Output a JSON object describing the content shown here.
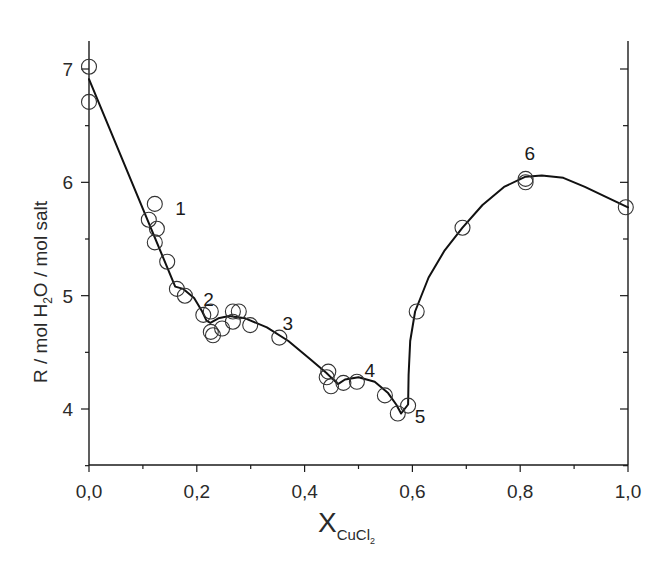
{
  "chart_data": {
    "type": "scatter",
    "title": "",
    "xlabel": "X",
    "xlabel_subscript": "CuCl",
    "xlabel_sub_subscript": "2",
    "ylabel_parts": [
      "R  /  mol H",
      "2",
      "O / mol salt"
    ],
    "ylabel": "R / mol H2O / mol salt",
    "xlim": [
      0.0,
      1.0
    ],
    "ylim": [
      3.5,
      7.25
    ],
    "grid": false,
    "legend": null,
    "x_ticks": [
      0.0,
      0.2,
      0.4,
      0.6,
      0.8,
      1.0
    ],
    "x_tick_labels": [
      "0,0",
      "0,2",
      "0,4",
      "0,6",
      "0,8",
      "1,0"
    ],
    "x_minor_ticks": [
      0.1,
      0.3,
      0.5,
      0.7,
      0.9
    ],
    "y_ticks": [
      4,
      5,
      6,
      7
    ],
    "y_tick_labels": [
      "4",
      "5",
      "6",
      "7"
    ],
    "y_minor_ticks": [
      3.5,
      4.5,
      5.5,
      6.5
    ],
    "series": [
      {
        "name": "experimental",
        "marker": "open-circle",
        "points": [
          [
            0.0,
            7.02
          ],
          [
            0.0,
            6.71
          ],
          [
            0.111,
            5.67
          ],
          [
            0.122,
            5.81
          ],
          [
            0.126,
            5.59
          ],
          [
            0.122,
            5.47
          ],
          [
            0.145,
            5.3
          ],
          [
            0.163,
            5.06
          ],
          [
            0.178,
            5.0
          ],
          [
            0.212,
            4.83
          ],
          [
            0.226,
            4.86
          ],
          [
            0.226,
            4.68
          ],
          [
            0.23,
            4.65
          ],
          [
            0.247,
            4.71
          ],
          [
            0.267,
            4.86
          ],
          [
            0.278,
            4.86
          ],
          [
            0.267,
            4.77
          ],
          [
            0.299,
            4.74
          ],
          [
            0.353,
            4.63
          ],
          [
            0.441,
            4.28
          ],
          [
            0.444,
            4.33
          ],
          [
            0.449,
            4.2
          ],
          [
            0.472,
            4.23
          ],
          [
            0.497,
            4.24
          ],
          [
            0.549,
            4.12
          ],
          [
            0.573,
            3.96
          ],
          [
            0.592,
            4.03
          ],
          [
            0.608,
            4.86
          ],
          [
            0.693,
            5.6
          ],
          [
            0.81,
            6.03
          ],
          [
            0.81,
            6.0
          ],
          [
            0.996,
            5.78
          ]
        ]
      },
      {
        "name": "fit",
        "line": "solid",
        "points": [
          [
            0.0,
            6.91
          ],
          [
            0.16,
            5.08
          ],
          [
            0.175,
            5.06
          ],
          [
            0.195,
            4.98
          ],
          [
            0.21,
            4.86
          ],
          [
            0.218,
            4.78
          ],
          [
            0.225,
            4.76
          ],
          [
            0.24,
            4.8
          ],
          [
            0.26,
            4.82
          ],
          [
            0.29,
            4.8
          ],
          [
            0.33,
            4.72
          ],
          [
            0.37,
            4.6
          ],
          [
            0.41,
            4.44
          ],
          [
            0.44,
            4.32
          ],
          [
            0.462,
            4.22
          ],
          [
            0.475,
            4.26
          ],
          [
            0.5,
            4.28
          ],
          [
            0.53,
            4.24
          ],
          [
            0.555,
            4.14
          ],
          [
            0.57,
            4.04
          ],
          [
            0.579,
            3.96
          ],
          [
            0.592,
            4.04
          ],
          [
            0.593,
            4.3
          ],
          [
            0.596,
            4.6
          ],
          [
            0.605,
            4.86
          ],
          [
            0.63,
            5.16
          ],
          [
            0.66,
            5.4
          ],
          [
            0.693,
            5.6
          ],
          [
            0.73,
            5.8
          ],
          [
            0.77,
            5.96
          ],
          [
            0.81,
            6.05
          ],
          [
            0.84,
            6.06
          ],
          [
            0.88,
            6.04
          ],
          [
            0.92,
            5.96
          ],
          [
            0.96,
            5.87
          ],
          [
            1.0,
            5.78
          ]
        ]
      }
    ],
    "annotations": [
      {
        "text": "1",
        "x": 0.17,
        "y": 5.71
      },
      {
        "text": "2",
        "x": 0.222,
        "y": 4.91
      },
      {
        "text": "3",
        "x": 0.369,
        "y": 4.7
      },
      {
        "text": "4",
        "x": 0.521,
        "y": 4.28
      },
      {
        "text": "5",
        "x": 0.614,
        "y": 3.88
      },
      {
        "text": "6",
        "x": 0.818,
        "y": 6.2
      }
    ]
  }
}
